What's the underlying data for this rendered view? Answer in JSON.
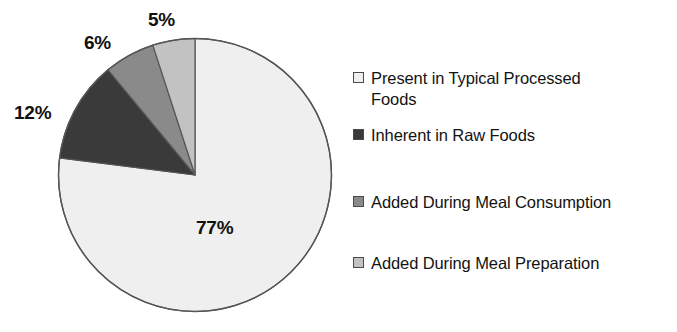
{
  "chart_data": {
    "type": "pie",
    "title": "",
    "subtitle": "",
    "xlabel": "",
    "ylabel": "",
    "grid": false,
    "legend_position": "right",
    "units": "percent",
    "categories": [
      "Present in Typical Processed Foods",
      "Inherent in Raw Foods",
      "Added During Meal Consumption",
      "Added During Meal Preparation"
    ],
    "values": [
      77,
      12,
      6,
      5
    ],
    "value_labels": [
      "77%",
      "12%",
      "6%",
      "5%"
    ],
    "colors": [
      "#efefef",
      "#3a3a3a",
      "#8a8a8a",
      "#c2c2c2"
    ],
    "slices": [
      {
        "label": "Present in Typical Processed Foods",
        "value": 77,
        "value_label": "77%",
        "color": "#efefef",
        "start_angle_deg": 0,
        "end_angle_deg": 277.2
      },
      {
        "label": "Inherent in Raw Foods",
        "value": 12,
        "value_label": "12%",
        "color": "#3a3a3a",
        "start_angle_deg": 277.2,
        "end_angle_deg": 320.4
      },
      {
        "label": "Added During Meal Consumption",
        "value": 6,
        "value_label": "6%",
        "color": "#8a8a8a",
        "start_angle_deg": 320.4,
        "end_angle_deg": 342.0
      },
      {
        "label": "Added During Meal Preparation",
        "value": 5,
        "value_label": "5%",
        "color": "#c2c2c2",
        "start_angle_deg": 342.0,
        "end_angle_deg": 360.0
      }
    ]
  },
  "labels": {
    "pct_77": "77%",
    "pct_12": "12%",
    "pct_6": "6%",
    "pct_5": "5%"
  },
  "legend": {
    "items": [
      {
        "label": "Present in Typical Processed Foods",
        "color": "#efefef"
      },
      {
        "label": "Inherent in Raw Foods",
        "color": "#3a3a3a"
      },
      {
        "label": "Added During Meal Consumption",
        "color": "#8a8a8a"
      },
      {
        "label": "Added During Meal Preparation",
        "color": "#c2c2c2"
      }
    ]
  },
  "style": {
    "background": "#ffffff",
    "outline": "#555555",
    "text": "#131313"
  }
}
